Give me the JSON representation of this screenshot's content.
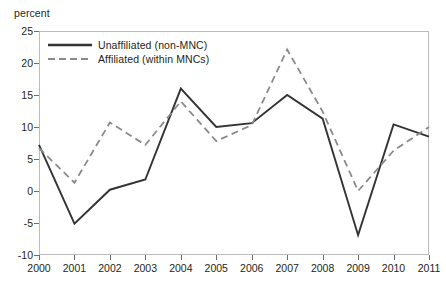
{
  "chart_data": {
    "type": "line",
    "title": "",
    "subtitle": "",
    "xlabel": "",
    "ylabel": "percent",
    "categories": [
      "2000",
      "2001",
      "2002",
      "2003",
      "2004",
      "2005",
      "2006",
      "2007",
      "2008",
      "2009",
      "2010",
      "2011"
    ],
    "series": [
      {
        "name": "Unaffiliated (non-MNC)",
        "style": "solid",
        "color": "#333333",
        "values": [
          7.2,
          -5.1,
          0.2,
          1.8,
          16.0,
          10.0,
          10.6,
          15.0,
          11.3,
          -6.9,
          10.4,
          8.5
        ]
      },
      {
        "name": "Affiliated (within MNCs)",
        "style": "dashed",
        "color": "#8a8a8a",
        "values": [
          6.7,
          1.3,
          10.7,
          7.2,
          14.0,
          7.8,
          10.3,
          22.1,
          12.4,
          0.0,
          6.3,
          10.0
        ]
      }
    ],
    "ylim": [
      -10,
      25
    ],
    "yticks": [
      25,
      20,
      15,
      10,
      5,
      0,
      -5,
      -10
    ],
    "ytick_labels": [
      "25",
      "20",
      "15",
      "10",
      "5",
      "0",
      "-5",
      "-10"
    ],
    "grid": false,
    "legend_position": "top-left",
    "annotations": []
  },
  "legend": {
    "items": [
      {
        "label": "Unaffiliated (non-MNC)",
        "style": "solid"
      },
      {
        "label": "Affiliated (within MNCs)",
        "style": "dashed"
      }
    ]
  },
  "colors": {
    "solid_series": "#333333",
    "dashed_series": "#8a8a8a",
    "axis": "#6d6e71",
    "frame_light": "#bcbcbc",
    "text": "#231f20",
    "background": "#ffffff"
  }
}
